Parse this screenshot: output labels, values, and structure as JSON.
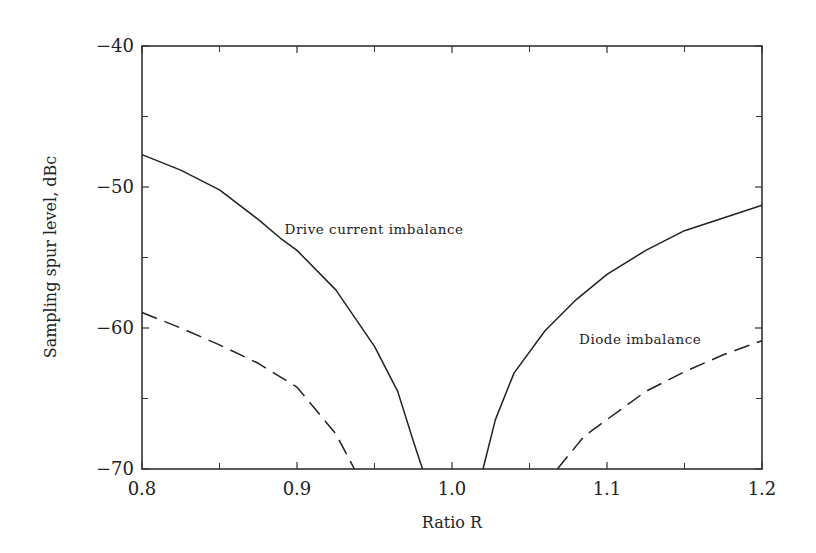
{
  "chart_data": {
    "type": "line",
    "title": "",
    "xlabel": "Ratio R",
    "ylabel": "Sampling spur level, dBc",
    "xlim": [
      0.8,
      1.2
    ],
    "ylim": [
      -70,
      -40
    ],
    "x_ticks": [
      0.8,
      0.9,
      1.0,
      1.1,
      1.2
    ],
    "x_tick_labels": [
      "0.8",
      "0.9",
      "1.0",
      "1.1",
      "1.2"
    ],
    "x_minor_ticks": [
      0.85,
      0.95,
      1.05,
      1.15
    ],
    "y_ticks": [
      -40,
      -50,
      -60,
      -70
    ],
    "y_tick_labels": [
      "−40",
      "−50",
      "−60",
      "−70"
    ],
    "y_minor_ticks": [
      -45,
      -55,
      -65
    ],
    "grid": false,
    "legend": null,
    "series": [
      {
        "name": "Drive current imbalance",
        "style": "solid",
        "segments": [
          {
            "x": [
              0.8,
              0.825,
              0.85,
              0.875,
              0.889,
              0.9,
              0.925,
              0.95,
              0.965,
              0.975,
              0.981
            ],
            "y": [
              -47.7,
              -48.8,
              -50.2,
              -52.3,
              -53.6,
              -54.5,
              -57.3,
              -61.3,
              -64.5,
              -68.0,
              -70.0
            ]
          },
          {
            "x": [
              1.02,
              1.028,
              1.04,
              1.06,
              1.08,
              1.1,
              1.125,
              1.15,
              1.175,
              1.2
            ],
            "y": [
              -70.0,
              -66.5,
              -63.2,
              -60.2,
              -58.0,
              -56.2,
              -54.5,
              -53.1,
              -52.2,
              -51.3
            ]
          }
        ]
      },
      {
        "name": "Diode imbalance",
        "style": "dashed",
        "segments": [
          {
            "x": [
              0.8,
              0.825,
              0.85,
              0.875,
              0.9,
              0.925,
              0.937
            ],
            "y": [
              -58.9,
              -60.0,
              -61.2,
              -62.5,
              -64.2,
              -67.5,
              -70.0
            ]
          },
          {
            "x": [
              1.068,
              1.085,
              1.1,
              1.125,
              1.15,
              1.175,
              1.2
            ],
            "y": [
              -70.0,
              -67.7,
              -66.5,
              -64.5,
              -63.1,
              -61.9,
              -60.9
            ]
          }
        ]
      }
    ],
    "annotations": [
      {
        "text": "Drive current imbalance",
        "x": 0.892,
        "y": -53.3
      },
      {
        "text": "Diode imbalance",
        "x": 1.082,
        "y": -61.1
      }
    ]
  },
  "layout": {
    "plot": {
      "left": 142,
      "top": 46,
      "right": 762,
      "bottom": 469
    },
    "line_color": "#222222",
    "axis_color": "#333333"
  }
}
